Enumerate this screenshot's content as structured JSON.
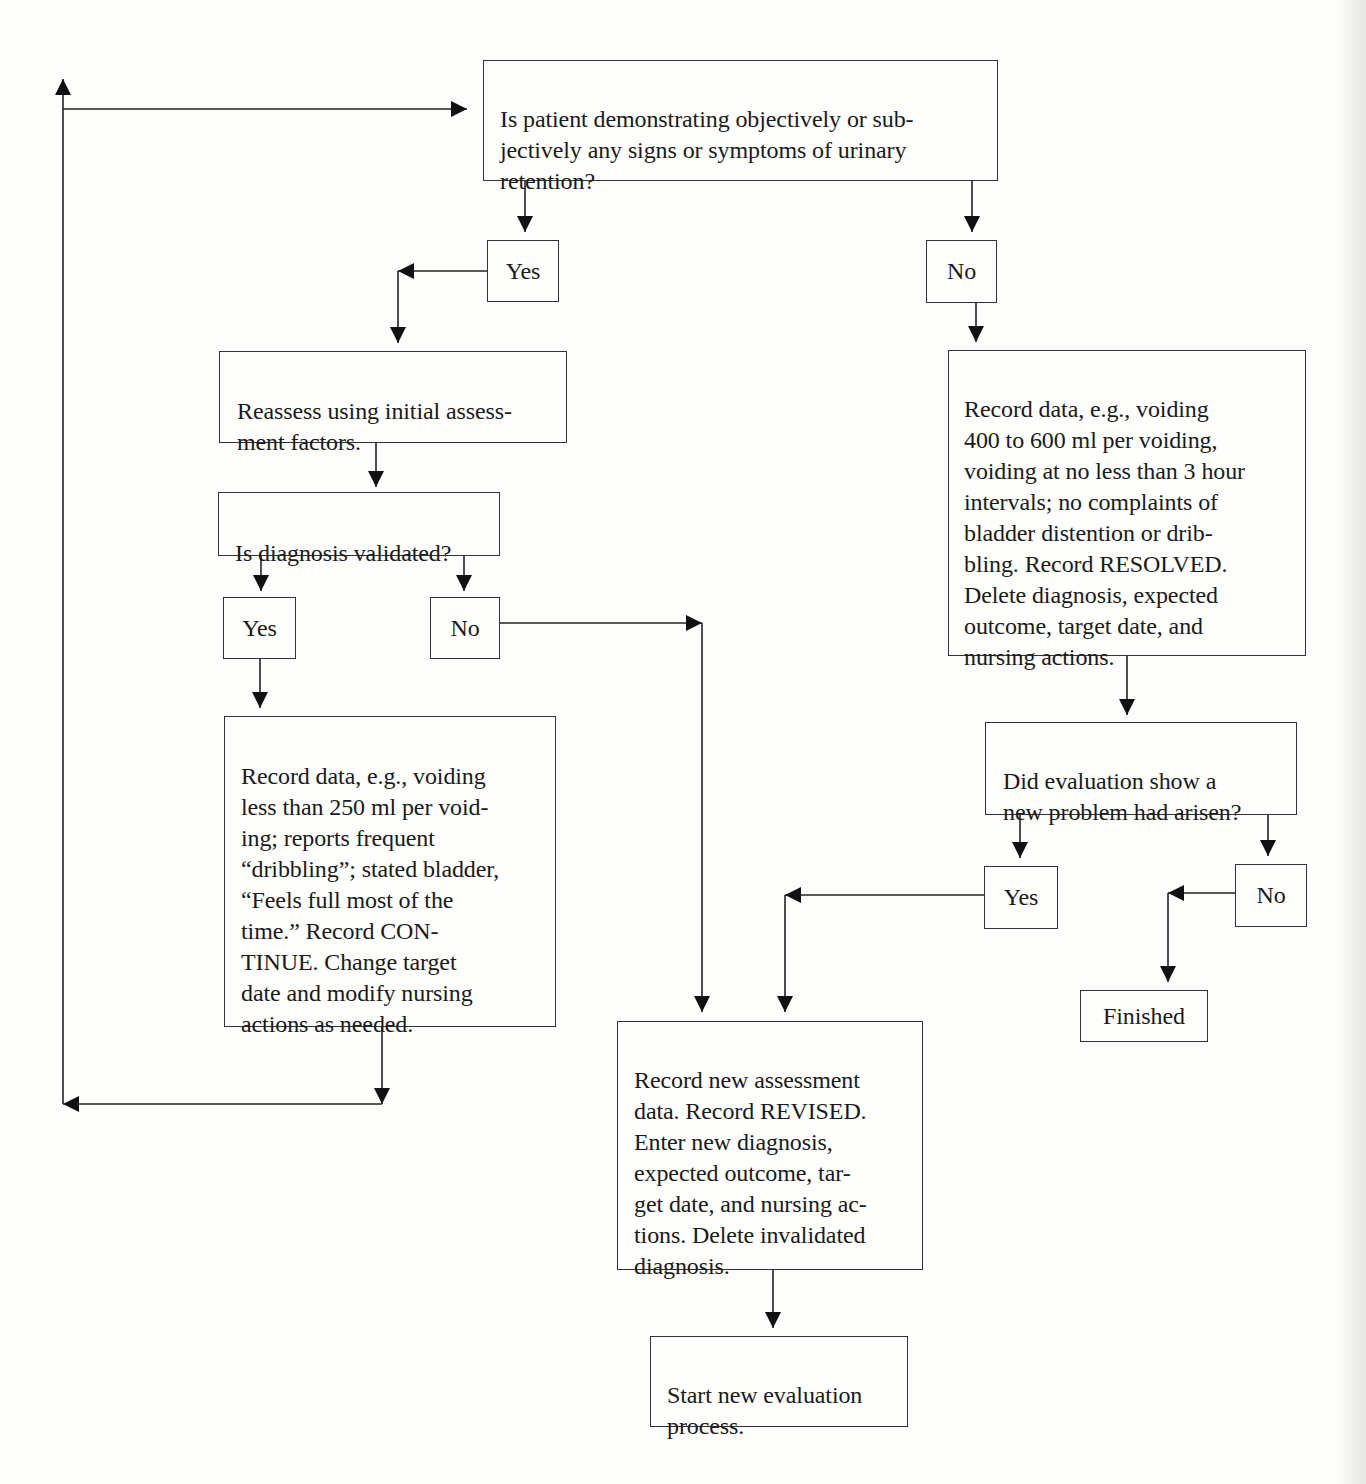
{
  "diagram": {
    "type": "flowchart",
    "topic": "Evaluation of nursing diagnosis: urinary retention",
    "nodes": {
      "start_question": {
        "text": "Is patient demonstrating objectively or sub-\njectively any signs or symptoms of urinary\nretention?"
      },
      "yes_1": {
        "text": "Yes"
      },
      "no_1": {
        "text": "No"
      },
      "reassess": {
        "text": "Reassess using initial assess-\nment factors."
      },
      "diagnosis_validated": {
        "text": "Is diagnosis validated?"
      },
      "yes_2": {
        "text": "Yes"
      },
      "no_2": {
        "text": "No"
      },
      "record_continue": {
        "text": "Record data, e.g., voiding\nless than 250 ml per void-\ning; reports frequent\n“dribbling”; stated bladder,\n“Feels full most of the\ntime.” Record CON-\nTINUE. Change target\ndate and modify nursing\nactions as needed."
      },
      "record_resolved": {
        "text": "Record data, e.g., voiding\n400 to 600 ml per voiding,\nvoiding at no less than 3 hour\nintervals; no complaints of\nbladder distention or drib-\nbling. Record RESOLVED.\nDelete diagnosis, expected\noutcome, target date, and\nnursing actions."
      },
      "new_problem": {
        "text": "Did evaluation show a\nnew problem had arisen?"
      },
      "yes_3": {
        "text": "Yes"
      },
      "no_3": {
        "text": "No"
      },
      "finished": {
        "text": "Finished"
      },
      "record_revised": {
        "text": "Record new assessment\ndata. Record REVISED.\nEnter new diagnosis,\nexpected outcome, tar-\nget date, and nursing ac-\ntions. Delete invalidated\ndiagnosis."
      },
      "start_new": {
        "text": "Start new evaluation\nprocess."
      }
    },
    "edges": [
      {
        "from": "start_question",
        "to": "yes_1"
      },
      {
        "from": "start_question",
        "to": "no_1"
      },
      {
        "from": "yes_1",
        "to": "reassess"
      },
      {
        "from": "reassess",
        "to": "diagnosis_validated"
      },
      {
        "from": "diagnosis_validated",
        "to": "yes_2"
      },
      {
        "from": "diagnosis_validated",
        "to": "no_2"
      },
      {
        "from": "yes_2",
        "to": "record_continue"
      },
      {
        "from": "record_continue",
        "to": "start_question",
        "note": "loop back"
      },
      {
        "from": "no_2",
        "to": "record_revised"
      },
      {
        "from": "no_1",
        "to": "record_resolved"
      },
      {
        "from": "record_resolved",
        "to": "new_problem"
      },
      {
        "from": "new_problem",
        "to": "yes_3"
      },
      {
        "from": "new_problem",
        "to": "no_3"
      },
      {
        "from": "yes_3",
        "to": "record_revised"
      },
      {
        "from": "no_3",
        "to": "finished"
      },
      {
        "from": "record_revised",
        "to": "start_new"
      }
    ],
    "colors": {
      "background": "#fdfdfc",
      "ink": "#1a1a1a",
      "border": "#333333"
    }
  }
}
